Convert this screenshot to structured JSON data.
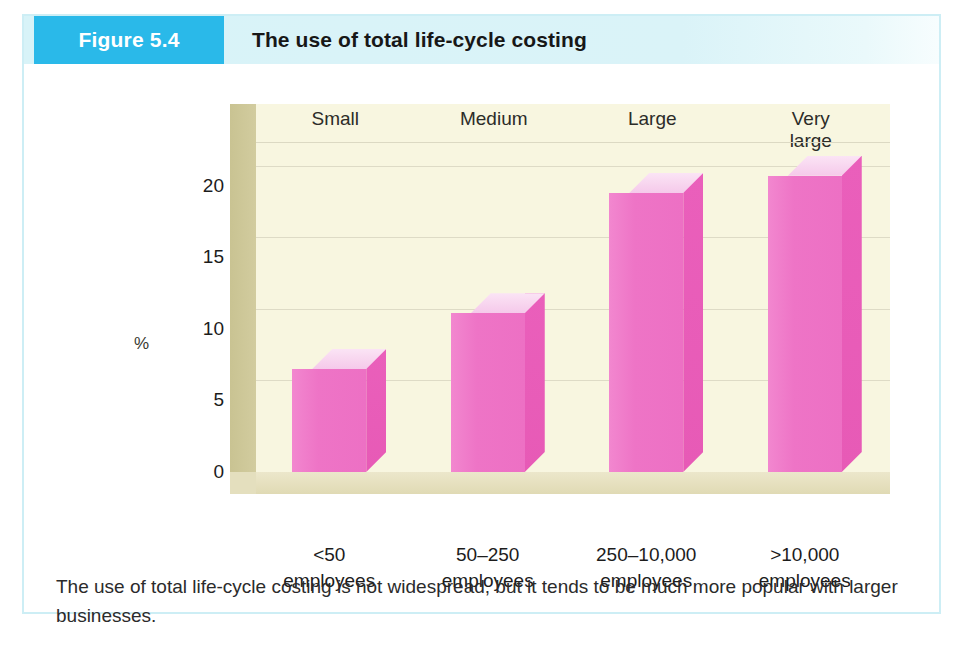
{
  "figure": {
    "tag": "Figure 5.4",
    "title": "The use of total life-cycle costing",
    "caption": "The use of total life-cycle costing is not widespread, but it tends to be much more popular with larger businesses."
  },
  "colors": {
    "tag_background": "#2ab9e9",
    "header_band": "#d8f3f8",
    "box_border": "#cdeef5",
    "bar_front": "#ee74c6",
    "bar_side": "#e85cb8",
    "bar_top": "#f7d3ef",
    "plot_background": "#f8f6e0",
    "wall": "#c9c392",
    "floor": "#e4dfbe"
  },
  "chart_data": {
    "type": "bar",
    "title": "The use of total life-cycle costing",
    "categories": [
      "<50\nemployees",
      "50–250\nemployees",
      "250–10,000\nemployees",
      ">10,000\nemployees"
    ],
    "category_top_labels": [
      "Small",
      "Medium",
      "Large",
      "Very large"
    ],
    "values": [
      7.2,
      11.1,
      19.5,
      20.7
    ],
    "xlabel": "",
    "ylabel": "%",
    "ylim": [
      0,
      22.5
    ],
    "yticks": [
      0,
      5,
      10,
      15,
      20
    ],
    "ytick_labels": [
      "0",
      "5",
      "10",
      "15",
      "20"
    ],
    "grid": true,
    "legend": false,
    "style": "3d-column"
  }
}
